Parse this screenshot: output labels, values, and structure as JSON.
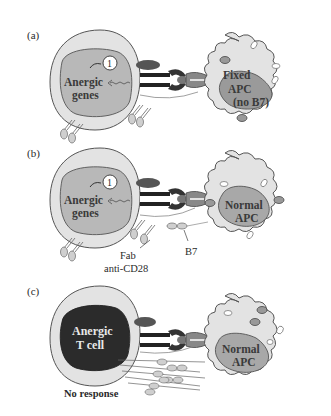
{
  "figure": {
    "panels": [
      {
        "letter": "(a)",
        "tcell_label_line1": "Anergic",
        "tcell_label_line2": "genes",
        "step_number": "1",
        "apc_label_line1": "Fixed",
        "apc_label_line2": "APC",
        "apc_label_line3": "(no B7)"
      },
      {
        "letter": "(b)",
        "tcell_label_line1": "Anergic",
        "tcell_label_line2": "genes",
        "step_number": "1",
        "apc_label_line1": "Normal",
        "apc_label_line2": "APC",
        "fab_label_line1": "Fab",
        "fab_label_line2": "anti-CD28",
        "b7_label": "B7"
      },
      {
        "letter": "(c)",
        "tcell_label_line1": "Anergic",
        "tcell_label_line2": "T cell",
        "apc_label_line1": "Normal",
        "apc_label_line2": "APC",
        "response_label": "No response"
      }
    ],
    "colors": {
      "cell_fill": "#e3e3e3",
      "nucleus_fill": "#b8b8b8",
      "apc_nucleus_fill": "#9a9a9a",
      "anergic_nucleus_fill": "#2b2b2b",
      "outline": "#555555"
    }
  }
}
